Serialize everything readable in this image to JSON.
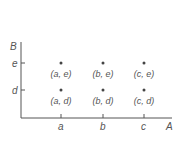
{
  "axes": {
    "x_label": "A",
    "y_label": "B"
  },
  "x_ticks": [
    "a",
    "b",
    "c"
  ],
  "y_ticks": [
    "d",
    "e"
  ],
  "points": [
    {
      "label": "(a, e)"
    },
    {
      "label": "(b, e)"
    },
    {
      "label": "(c, e)"
    },
    {
      "label": "(a, d)"
    },
    {
      "label": "(b, d)"
    },
    {
      "label": "(c, d)"
    }
  ]
}
